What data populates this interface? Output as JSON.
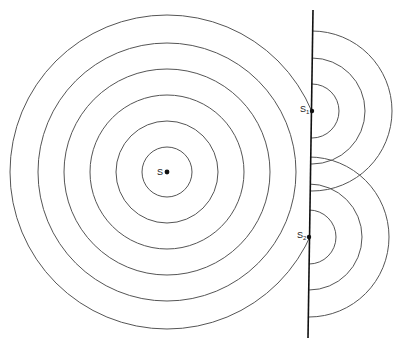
{
  "diagram": {
    "title": "",
    "colors": {
      "stroke": "#555555",
      "barrier": "#111111",
      "dot": "#111111"
    },
    "main_source": {
      "label": "S",
      "cx": 167,
      "cy": 172,
      "radii": [
        25,
        51,
        77,
        103,
        129,
        157
      ]
    },
    "barrier": {
      "x1": 313,
      "y1": 10,
      "x2": 308,
      "y2": 338
    },
    "slit_sources": [
      {
        "label": "S",
        "subscript": "1",
        "cx": 312,
        "cy": 111,
        "radii": [
          27,
          53,
          80
        ]
      },
      {
        "label": "S",
        "subscript": "2",
        "cx": 309,
        "cy": 237,
        "radii": [
          27,
          53,
          80
        ]
      }
    ]
  }
}
